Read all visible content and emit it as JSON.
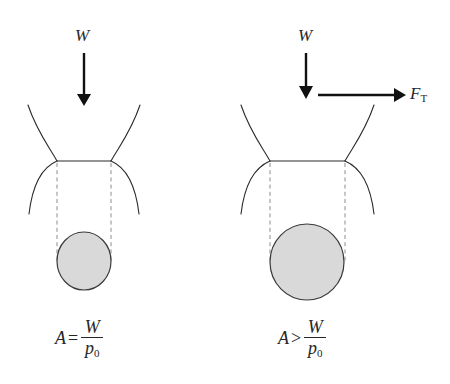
{
  "figure": {
    "background_color": "#ffffff",
    "stroke_color": "#2b2b2b",
    "arrow_color": "#111111",
    "dashed_guide_color": "#8c8c8c",
    "contact_patch_fill": "#d9d9d9",
    "contact_patch_stroke": "#3a3a3a",
    "width": 450,
    "height": 384
  },
  "panels": [
    {
      "id": "free-rolling",
      "vertical_load_label": "W",
      "traction_force_label": null,
      "traction_force_subscript": null,
      "equation": {
        "lhs": "A",
        "relation": "=",
        "numerator": "W",
        "denominator": "p",
        "denominator_subscript": "0",
        "plain": "A = W / p0"
      },
      "contact_line_x_start": 57,
      "contact_line_x_end": 111,
      "contact_line_y": 161,
      "contact_patch_center_x": 84,
      "contact_patch_center_y": 261,
      "contact_patch_radius_x": 27,
      "contact_patch_radius_y": 29,
      "vertical_arrow_x": 84,
      "vertical_arrow_y_start": 53,
      "vertical_arrow_y_end": 104
    },
    {
      "id": "driven-with-traction",
      "vertical_load_label": "W",
      "traction_force_label": "F",
      "traction_force_subscript": "T",
      "equation": {
        "lhs": "A",
        "relation": ">",
        "numerator": "W",
        "denominator": "p",
        "denominator_subscript": "0",
        "plain": "A > W / p0"
      },
      "contact_line_x_start": 270,
      "contact_line_x_end": 345,
      "contact_line_y": 161,
      "contact_patch_center_x": 307,
      "contact_patch_center_y": 262,
      "contact_patch_radius_x": 37,
      "contact_patch_radius_y": 38,
      "vertical_arrow_x": 306,
      "vertical_arrow_y_start": 53,
      "vertical_arrow_y_end": 97,
      "horizontal_arrow_y": 95,
      "horizontal_arrow_x_start": 318,
      "horizontal_arrow_x_end": 404
    }
  ],
  "labels": {
    "left_W": "W",
    "right_W": "W",
    "traction_F": "F",
    "traction_sub": "T",
    "left_eq_lhs": "A",
    "left_eq_rel": "=",
    "left_eq_num": "W",
    "left_eq_den": "p",
    "left_eq_den_sub": "0",
    "right_eq_lhs": "A",
    "right_eq_rel": ">",
    "right_eq_num": "W",
    "right_eq_den": "p",
    "right_eq_den_sub": "0"
  }
}
